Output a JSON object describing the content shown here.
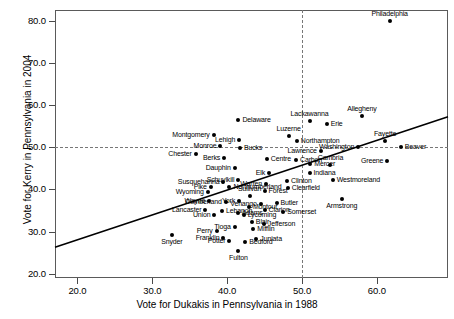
{
  "chart_data": {
    "type": "scatter",
    "title": "",
    "xlabel": "Vote for Dukakis in Pennsylvania in 1988",
    "ylabel": "Vote for Kerry in Pennsylvania in 2004",
    "xlim": [
      17.0,
      69.5
    ],
    "ylim": [
      19.0,
      82.5
    ],
    "xticks": [
      "20.0",
      "30.0",
      "40.0",
      "50.0",
      "60.0"
    ],
    "xtick_values": [
      20.0,
      30.0,
      40.0,
      50.0,
      60.0
    ],
    "yticks": [
      "20.0",
      "30.0",
      "40.0",
      "50.0",
      "60.0",
      "70.0",
      "80.0"
    ],
    "ytick_values": [
      20.0,
      30.0,
      40.0,
      50.0,
      60.0,
      70.0,
      80.0
    ],
    "grid": false,
    "legend": "none",
    "reference_lines": [
      {
        "orientation": "horizontal",
        "value": 50.0,
        "style": "dashed"
      },
      {
        "orientation": "vertical",
        "value": 50.0,
        "style": "dashed"
      }
    ],
    "fit_line": {
      "style": "solid",
      "x_start": 17.0,
      "y_start": 26.3,
      "x_end": 69.5,
      "y_end": 57.2
    },
    "point_color": "#000000",
    "points": [
      {
        "name": "Philadelphia",
        "x": 61.7,
        "y": 80.0,
        "lp": "above"
      },
      {
        "name": "Allegheny",
        "x": 58.0,
        "y": 57.3,
        "lp": "above"
      },
      {
        "name": "Delaware",
        "x": 41.5,
        "y": 56.4,
        "lp": "right"
      },
      {
        "name": "Lackawanna",
        "x": 51.0,
        "y": 56.2,
        "lp": "above"
      },
      {
        "name": "Erie",
        "x": 53.3,
        "y": 55.5,
        "lp": "right"
      },
      {
        "name": "Montgomery",
        "x": 38.2,
        "y": 52.9,
        "lp": "left"
      },
      {
        "name": "Luzerne",
        "x": 48.2,
        "y": 52.6,
        "lp": "above"
      },
      {
        "name": "Lehigh",
        "x": 41.6,
        "y": 51.8,
        "lp": "left"
      },
      {
        "name": "Northampton",
        "x": 49.3,
        "y": 51.4,
        "lp": "right"
      },
      {
        "name": "Fayette",
        "x": 61.1,
        "y": 51.5,
        "lp": "above"
      },
      {
        "name": "Monroe",
        "x": 39.1,
        "y": 50.2,
        "lp": "left"
      },
      {
        "name": "Bucks",
        "x": 41.7,
        "y": 49.9,
        "lp": "right"
      },
      {
        "name": "Washington",
        "x": 57.5,
        "y": 50.0,
        "lp": "left"
      },
      {
        "name": "Beaver",
        "x": 63.2,
        "y": 50.1,
        "lp": "right"
      },
      {
        "name": "Lawrence",
        "x": 52.5,
        "y": 49.2,
        "lp": "left"
      },
      {
        "name": "Chester",
        "x": 35.8,
        "y": 48.4,
        "lp": "left"
      },
      {
        "name": "Berks",
        "x": 39.6,
        "y": 47.5,
        "lp": "left"
      },
      {
        "name": "Centre",
        "x": 45.3,
        "y": 47.2,
        "lp": "right"
      },
      {
        "name": "Carbon",
        "x": 49.2,
        "y": 46.9,
        "lp": "right"
      },
      {
        "name": "Greene",
        "x": 61.4,
        "y": 46.8,
        "lp": "left"
      },
      {
        "name": "Cambria",
        "x": 53.8,
        "y": 45.7,
        "lp": "above"
      },
      {
        "name": "Mercer",
        "x": 51.1,
        "y": 45.9,
        "lp": "right"
      },
      {
        "name": "Dauphin",
        "x": 41.0,
        "y": 45.1,
        "lp": "left"
      },
      {
        "name": "Indiana",
        "x": 51.0,
        "y": 43.9,
        "lp": "right"
      },
      {
        "name": "Elk",
        "x": 45.6,
        "y": 43.8,
        "lp": "left"
      },
      {
        "name": "Schuylkill",
        "x": 41.5,
        "y": 42.2,
        "lp": "left"
      },
      {
        "name": "Westmoreland",
        "x": 54.1,
        "y": 42.3,
        "lp": "right"
      },
      {
        "name": "Clinton",
        "x": 48.0,
        "y": 42.0,
        "lp": "right"
      },
      {
        "name": "Susquehanna",
        "x": 39.5,
        "y": 41.8,
        "lp": "left"
      },
      {
        "name": "Warren",
        "x": 45.2,
        "y": 41.3,
        "lp": "left"
      },
      {
        "name": "Pike",
        "x": 37.8,
        "y": 40.5,
        "lp": "left"
      },
      {
        "name": "Northumberland",
        "x": 40.3,
        "y": 40.6,
        "lp": "right"
      },
      {
        "name": "Clearfield",
        "x": 48.1,
        "y": 40.3,
        "lp": "right"
      },
      {
        "name": "Forest",
        "x": 45.0,
        "y": 39.7,
        "lp": "right"
      },
      {
        "name": "Wyoming",
        "x": 37.4,
        "y": 39.3,
        "lp": "left"
      },
      {
        "name": "Sullivan",
        "x": 43.0,
        "y": 38.4,
        "lp": "above"
      },
      {
        "name": "Armstrong",
        "x": 55.3,
        "y": 37.8,
        "lp": "below"
      },
      {
        "name": "Wayne",
        "x": 37.6,
        "y": 37.2,
        "lp": "left"
      },
      {
        "name": "York",
        "x": 41.6,
        "y": 37.3,
        "lp": "left"
      },
      {
        "name": "Cumberland",
        "x": 39.8,
        "y": 37.1,
        "lp": "left"
      },
      {
        "name": "Butler",
        "x": 46.6,
        "y": 36.8,
        "lp": "right"
      },
      {
        "name": "Venango",
        "x": 44.5,
        "y": 36.6,
        "lp": "left"
      },
      {
        "name": "Montour",
        "x": 42.9,
        "y": 35.9,
        "lp": "right"
      },
      {
        "name": "Lancaster",
        "x": 37.1,
        "y": 35.2,
        "lp": "left"
      },
      {
        "name": "Lebanon",
        "x": 39.3,
        "y": 34.9,
        "lp": "right"
      },
      {
        "name": "Clarion",
        "x": 45.0,
        "y": 35.1,
        "lp": "right"
      },
      {
        "name": "Somerset",
        "x": 47.5,
        "y": 34.6,
        "lp": "right"
      },
      {
        "name": "Adams",
        "x": 41.4,
        "y": 34.3,
        "lp": "right"
      },
      {
        "name": "Union",
        "x": 38.3,
        "y": 33.9,
        "lp": "left"
      },
      {
        "name": "Lycoming",
        "x": 42.2,
        "y": 33.9,
        "lp": "right"
      },
      {
        "name": "Blair",
        "x": 43.3,
        "y": 32.2,
        "lp": "right"
      },
      {
        "name": "Jefferson",
        "x": 44.9,
        "y": 31.9,
        "lp": "right"
      },
      {
        "name": "Tioga",
        "x": 41.0,
        "y": 31.2,
        "lp": "left"
      },
      {
        "name": "Mifflin",
        "x": 43.5,
        "y": 30.5,
        "lp": "right"
      },
      {
        "name": "Perry",
        "x": 38.6,
        "y": 30.1,
        "lp": "left"
      },
      {
        "name": "Snyder",
        "x": 32.6,
        "y": 29.1,
        "lp": "below"
      },
      {
        "name": "Franklin",
        "x": 39.5,
        "y": 28.5,
        "lp": "left"
      },
      {
        "name": "Juniata",
        "x": 43.9,
        "y": 28.2,
        "lp": "right"
      },
      {
        "name": "Potter",
        "x": 40.3,
        "y": 27.8,
        "lp": "left"
      },
      {
        "name": "Bedford",
        "x": 42.4,
        "y": 27.6,
        "lp": "right"
      },
      {
        "name": "Fulton",
        "x": 41.5,
        "y": 25.3,
        "lp": "below"
      }
    ]
  }
}
